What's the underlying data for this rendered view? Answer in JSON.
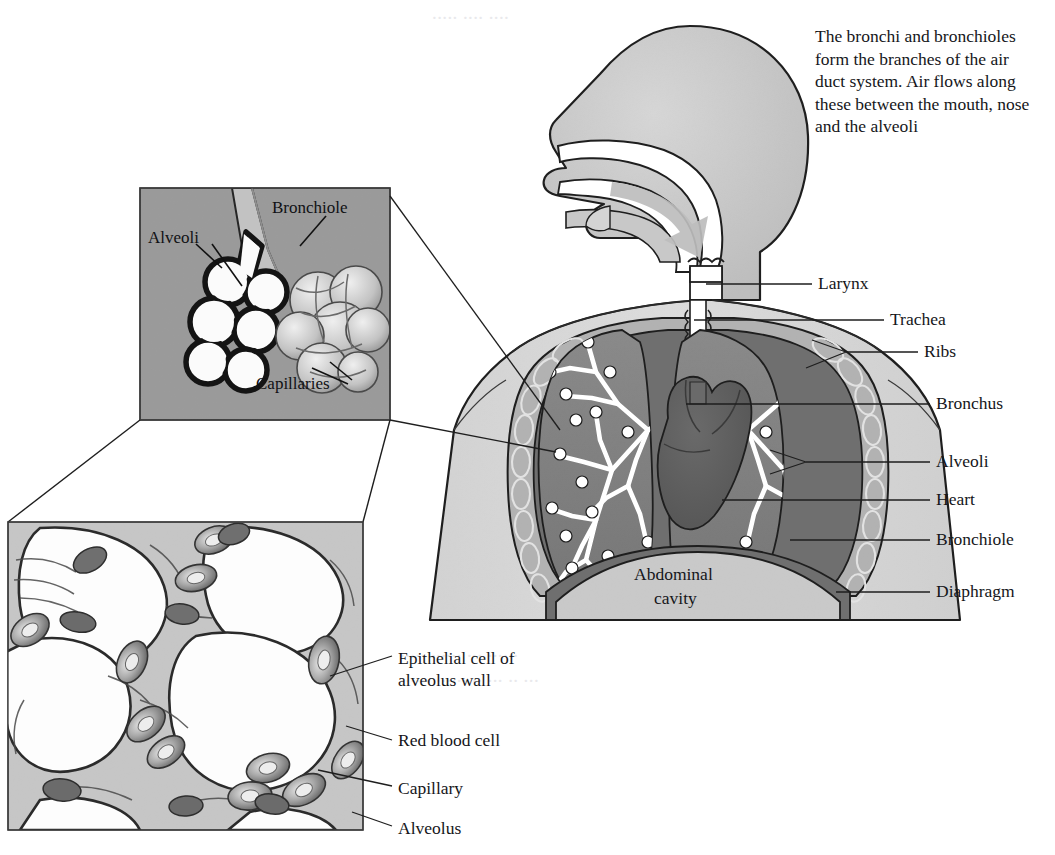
{
  "figure": {
    "caption": "The bronchi and bronchioles form the branches of the air duct system. Air flows along these between the mouth, nose and the alveoli"
  },
  "torso_labels": [
    {
      "id": "larynx",
      "text": "Larynx"
    },
    {
      "id": "trachea",
      "text": "Trachea"
    },
    {
      "id": "ribs",
      "text": "Ribs"
    },
    {
      "id": "bronchus",
      "text": "Bronchus"
    },
    {
      "id": "alveoli",
      "text": "Alveoli"
    },
    {
      "id": "heart",
      "text": "Heart"
    },
    {
      "id": "bronchiole",
      "text": "Bronchiole"
    },
    {
      "id": "diaphragm",
      "text": "Diaphragm"
    }
  ],
  "internal_labels": [
    {
      "id": "abdominal-cavity",
      "line1": "Abdominal",
      "line2": "cavity"
    }
  ],
  "inset_panel": {
    "name": "alveoli-bronchiole-inset",
    "labels": [
      {
        "id": "alveoli",
        "text": "Alveoli"
      },
      {
        "id": "bronchiole",
        "text": "Bronchiole"
      },
      {
        "id": "capillaries",
        "text": "Capillaries"
      }
    ]
  },
  "micrograph_panel": {
    "name": "alveolus-wall-detail",
    "labels": [
      {
        "id": "epithelial-cell",
        "line1": "Epithelial cell of",
        "line2": "alveolus wall"
      },
      {
        "id": "red-blood-cell",
        "text": "Red blood cell"
      },
      {
        "id": "capillary",
        "text": "Capillary"
      },
      {
        "id": "alveolus",
        "text": "Alveolus"
      }
    ]
  },
  "colors": {
    "page": "#ffffff",
    "ink": "#1a1a1a",
    "body_fill": "#d9d9d9",
    "head_fill": "#c8c8c8",
    "rib_band": "#b0b0b0",
    "lung_fill": "#7f7f7f",
    "heart_fill": "#5e5e5e",
    "inset_bg": "#9a9a9a",
    "micro_bg": "#c6c6c6",
    "airway_white": "#ffffff",
    "arrow_gray": "#bdbdbd"
  }
}
